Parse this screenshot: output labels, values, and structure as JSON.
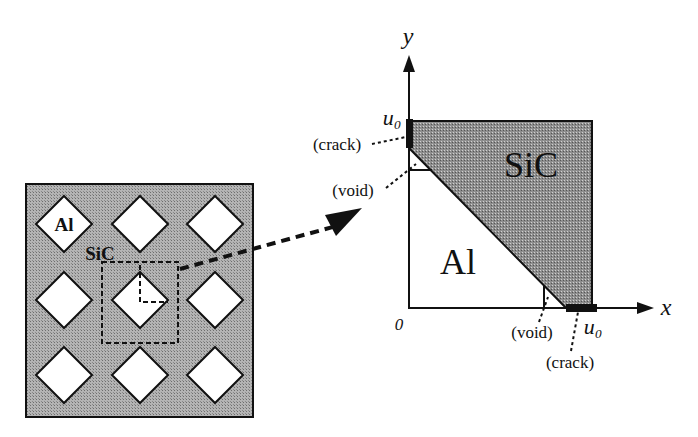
{
  "left_panel": {
    "matrix_label": "SiC",
    "inclusion_label": "Al",
    "grid_rows": 3,
    "grid_cols": 3,
    "matrix_color": "#a8a8a8",
    "inclusion_color": "#ffffff"
  },
  "right_panel": {
    "x_axis_label": "x",
    "y_axis_label": "y",
    "origin_label": "0",
    "u0_label_y": "u₀",
    "u0_label_x": "u₀",
    "region_sic_label": "SiC",
    "region_al_label": "Al",
    "crack_label_top": "(crack)",
    "void_label_top": "(void)",
    "void_label_bottom": "(void)",
    "crack_label_bottom": "(crack)",
    "sic_color": "#8c8c8c"
  }
}
